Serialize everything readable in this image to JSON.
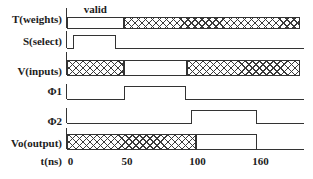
{
  "diagram": {
    "annotation": {
      "text": "valid"
    },
    "signals": [
      {
        "label": "T(weights)",
        "segments": [
          {
            "t0": 0,
            "t1": 50,
            "style": "valid",
            "annotation": "valid"
          },
          {
            "t0": 50,
            "t1": 200,
            "style": "hatch"
          }
        ]
      },
      {
        "label": "S(select)",
        "segments": [
          {
            "t0": 0,
            "t1": 5,
            "style": "low"
          },
          {
            "t0": 5,
            "t1": 43,
            "style": "high"
          },
          {
            "t0": 43,
            "t1": 204,
            "style": "low"
          }
        ]
      },
      {
        "label": "V(inputs)",
        "segments": [
          {
            "t0": 0,
            "t1": 50,
            "style": "hatch"
          },
          {
            "t0": 50,
            "t1": 95,
            "style": "valid"
          },
          {
            "t0": 95,
            "t1": 200,
            "style": "hatch"
          }
        ]
      },
      {
        "label": "Φ1",
        "segments": [
          {
            "t0": 0,
            "t1": 50,
            "style": "low"
          },
          {
            "t0": 50,
            "t1": 94,
            "style": "high"
          },
          {
            "t0": 94,
            "t1": 204,
            "style": "low"
          }
        ]
      },
      {
        "label": "Φ2",
        "segments": [
          {
            "t0": 0,
            "t1": 98,
            "style": "low"
          },
          {
            "t0": 98,
            "t1": 160,
            "style": "high"
          },
          {
            "t0": 160,
            "t1": 204,
            "style": "low"
          }
        ]
      },
      {
        "label": "Vo(output)",
        "segments": [
          {
            "t0": 0,
            "t1": 102,
            "style": "hatch"
          },
          {
            "t0": 102,
            "t1": 160,
            "style": "valid"
          },
          {
            "t0": 160,
            "t1": 204,
            "style": "low"
          }
        ]
      }
    ],
    "axis": {
      "label": "t(ns)",
      "ticks": [
        {
          "t": 0,
          "label": "0"
        },
        {
          "t": 50,
          "label": "50"
        },
        {
          "t": 100,
          "label": "100"
        },
        {
          "t": 160,
          "label": "160"
        }
      ]
    },
    "colors": {
      "line": "#333333",
      "background": "#ffffff"
    }
  }
}
